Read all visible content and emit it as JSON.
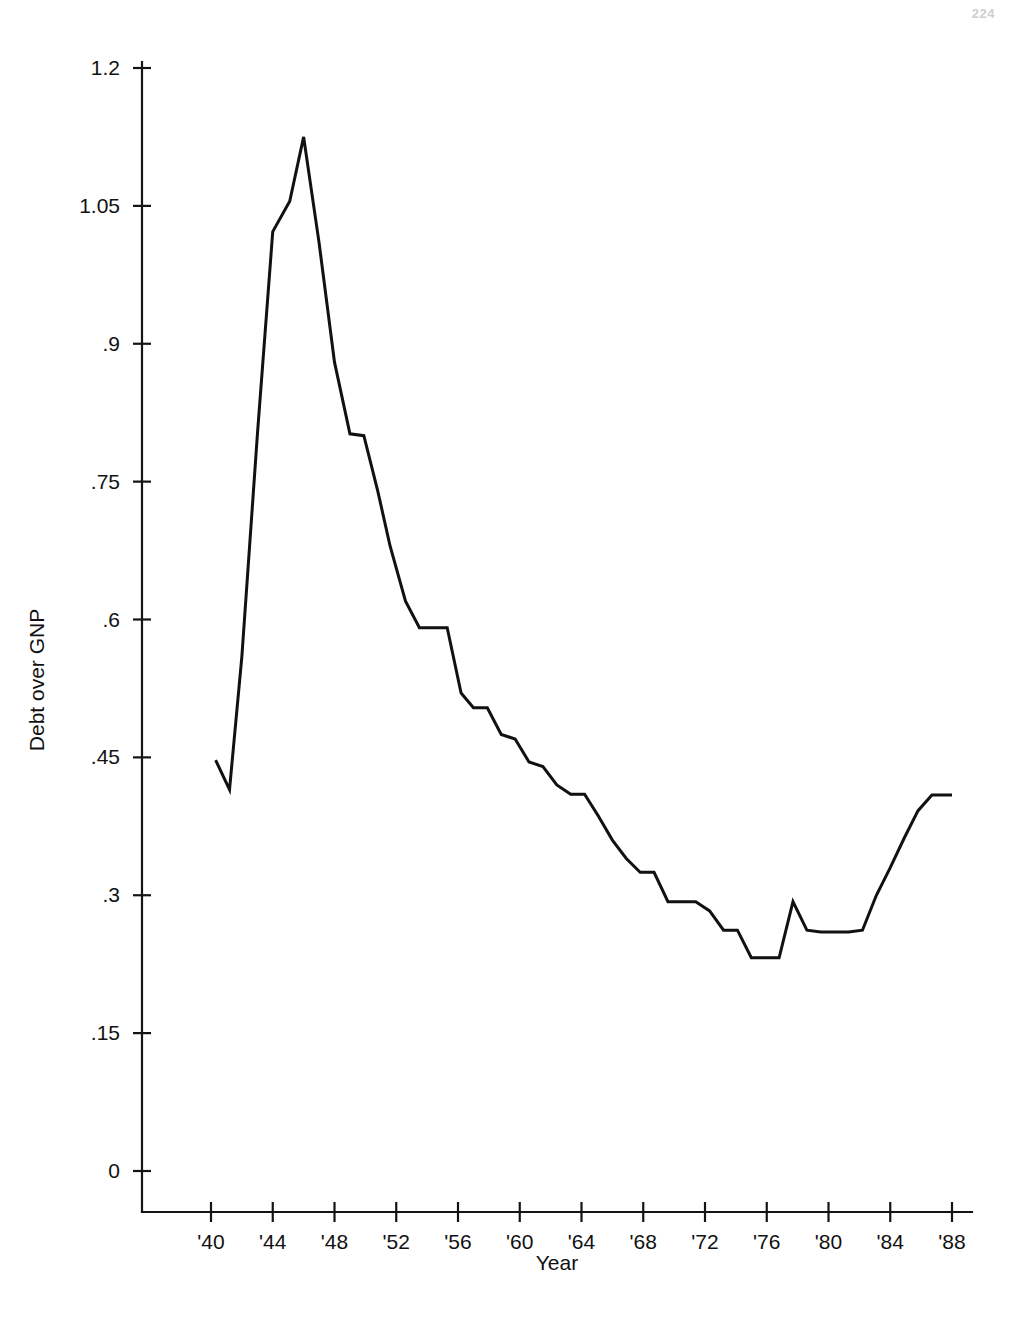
{
  "page": {
    "page_number": "224",
    "background_color": "#ffffff",
    "ink_color": "#111111"
  },
  "chart_data": {
    "type": "line",
    "title": "",
    "subtitle": "",
    "xlabel": "Year",
    "ylabel": "Debt over GNP",
    "xlim": [
      1939.0,
      1989.2
    ],
    "ylim": [
      0,
      1.2
    ],
    "grid": false,
    "legend": null,
    "legend_position": "none",
    "y_ticks": [
      0,
      0.15,
      0.3,
      0.45,
      0.6,
      0.75,
      0.9,
      1.05,
      1.2
    ],
    "y_tick_labels": [
      "0",
      ".15",
      ".3",
      ".45",
      ".6",
      ".75",
      ".9",
      "1.05",
      "1.2"
    ],
    "x_ticks": [
      1940,
      1944,
      1948,
      1952,
      1956,
      1960,
      1964,
      1968,
      1972,
      1976,
      1980,
      1984,
      1988
    ],
    "x_tick_labels": [
      "'40",
      "'44",
      "'48",
      "'52",
      "'56",
      "'60",
      "'64",
      "'68",
      "'72",
      "'76",
      "'80",
      "'84",
      "'88"
    ],
    "series": [
      {
        "name": "Debt over GNP",
        "color": "#111111",
        "x": [
          1940.3,
          1941.2,
          1942.0,
          1943.0,
          1944.0,
          1945.1,
          1946.0,
          1947.0,
          1948.0,
          1949.0,
          1949.9,
          1950.8,
          1951.6,
          1952.6,
          1953.5,
          1954.4,
          1955.3,
          1956.2,
          1957.0,
          1957.9,
          1958.8,
          1959.7,
          1960.6,
          1961.5,
          1962.4,
          1963.3,
          1964.2,
          1965.1,
          1966.0,
          1966.9,
          1967.8,
          1968.7,
          1969.6,
          1970.5,
          1971.4,
          1972.3,
          1973.2,
          1974.1,
          1975.0,
          1975.9,
          1976.8,
          1977.7,
          1978.6,
          1979.5,
          1980.4,
          1981.3,
          1982.2,
          1983.1,
          1984.0,
          1984.9,
          1985.8,
          1986.7,
          1987.6,
          1988.0
        ],
        "y": [
          0.447,
          0.415,
          0.56,
          0.8,
          1.022,
          1.055,
          1.125,
          1.01,
          0.88,
          0.802,
          0.8,
          0.74,
          0.68,
          0.62,
          0.591,
          0.591,
          0.591,
          0.52,
          0.504,
          0.504,
          0.475,
          0.47,
          0.445,
          0.44,
          0.42,
          0.41,
          0.41,
          0.386,
          0.36,
          0.34,
          0.325,
          0.325,
          0.293,
          0.293,
          0.293,
          0.283,
          0.262,
          0.262,
          0.232,
          0.232,
          0.232,
          0.293,
          0.262,
          0.26,
          0.26,
          0.26,
          0.262,
          0.3,
          0.33,
          0.362,
          0.392,
          0.409,
          0.409,
          0.409
        ]
      }
    ],
    "annotations": []
  },
  "geometry": {
    "plot_left_px": 142,
    "plot_right_px": 972,
    "axis_y_zero_px": 1171,
    "axis_y_top_px": 68,
    "x_axis_baseline_px": 1212,
    "x_at_1940_px": 211,
    "x_at_1988_px": 952
  }
}
